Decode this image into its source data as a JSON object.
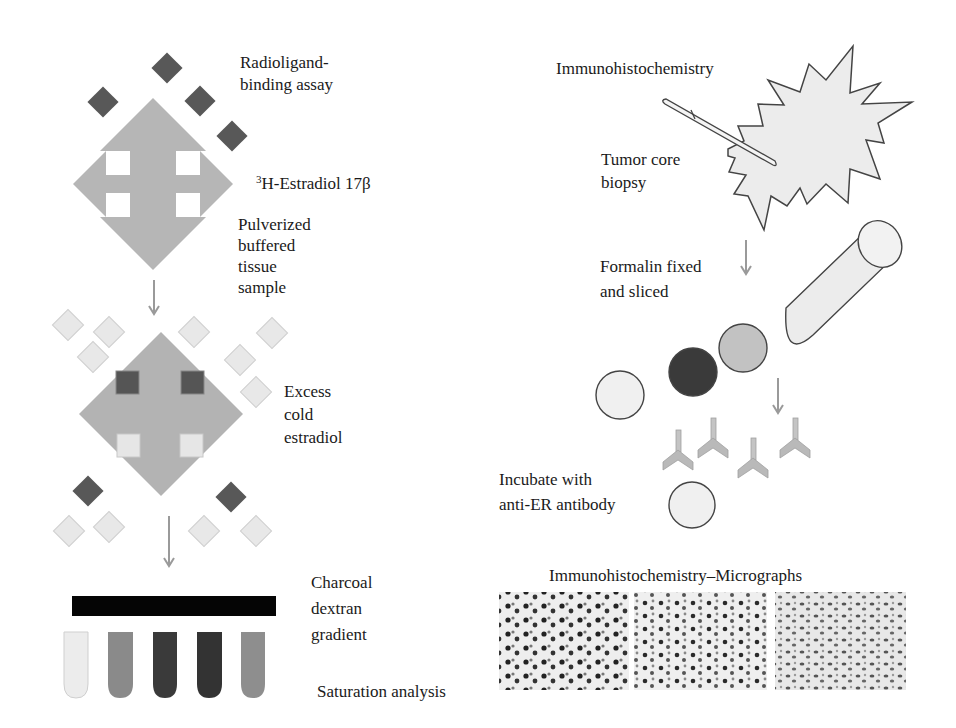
{
  "left_panel": {
    "title_line1": "Radioligand-",
    "title_line2": "binding assay",
    "ligand_sup": "3",
    "ligand_label": "H-Estradiol 17β",
    "sample_lines": [
      "Pulverized",
      "buffered",
      "tissue",
      "sample"
    ],
    "cold_lines": [
      "Excess",
      "cold",
      "estradiol"
    ],
    "gradient_lines": [
      "Charcoal",
      "dextran",
      "gradient"
    ],
    "analysis_label": "Saturation analysis",
    "tube_colors": [
      "#ececec",
      "#8a8a8a",
      "#3a3a3a",
      "#333333",
      "#8e8e8e"
    ]
  },
  "right_panel": {
    "title": "Immunohistochemistry",
    "biopsy_lines": [
      "Tumor core",
      "biopsy"
    ],
    "fixed_lines": [
      "Formalin fixed",
      "and sliced"
    ],
    "incubate_lines": [
      "Incubate with",
      "anti-ER antibody"
    ],
    "micrographs_title": "Immunohistochemistry–Micrographs",
    "micrograph_count": 3
  },
  "colors": {
    "arrow_gray": "#9a9a9a",
    "receptor_gray": "#b4b4b4",
    "dark_ligand": "#555555",
    "light_ligand": "#e6e6e6",
    "charcoal_bar": "#050505"
  }
}
